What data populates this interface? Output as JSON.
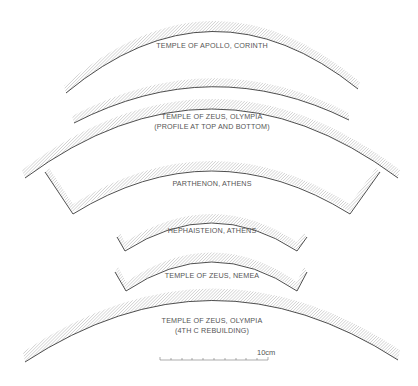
{
  "diagram": {
    "type": "architectural-profiles",
    "colors": {
      "line": "#3a3a3a",
      "hatch": "#b8b8b8",
      "text": "#555555",
      "background": "#ffffff"
    },
    "profiles": [
      {
        "id": "apollo-corinth",
        "label_lines": [
          "TEMPLE OF APOLLO, CORINTH"
        ]
      },
      {
        "id": "zeus-olympia",
        "label_lines": [
          "TEMPLE OF ZEUS, OLYMPIA",
          "(PROFILE AT TOP AND BOTTOM)"
        ]
      },
      {
        "id": "parthenon",
        "label_lines": [
          "PARTHENON, ATHENS"
        ]
      },
      {
        "id": "hephaisteion",
        "label_lines": [
          "HEPHAISTEION, ATHENS"
        ]
      },
      {
        "id": "zeus-nemea",
        "label_lines": [
          "TEMPLE OF ZEUS, NEMEA"
        ]
      },
      {
        "id": "zeus-olympia-4th",
        "label_lines": [
          "TEMPLE OF ZEUS, OLYMPIA",
          "(4TH C REBUILDING)"
        ]
      }
    ],
    "scale_bar": {
      "label": "10cm",
      "ticks": 10
    }
  }
}
